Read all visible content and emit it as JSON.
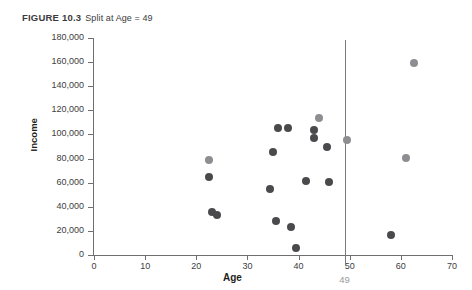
{
  "caption": {
    "label": "FIGURE 10.3",
    "text": "Split at Age = 49"
  },
  "chart_data": {
    "type": "scatter",
    "title": "Split at Age = 49",
    "xlabel": "Age",
    "ylabel": "Income",
    "xlim": [
      0,
      70
    ],
    "ylim": [
      0,
      180000
    ],
    "xticks": [
      0,
      10,
      20,
      30,
      40,
      50,
      60,
      70
    ],
    "xtick_labels": [
      "0",
      "10",
      "20",
      "30",
      "40",
      "50",
      "60",
      "70"
    ],
    "yticks": [
      0,
      20000,
      40000,
      60000,
      80000,
      100000,
      120000,
      140000,
      160000,
      180000
    ],
    "ytick_labels": [
      "0",
      "20,000",
      "40,000",
      "60,000",
      "80,000",
      "100,000",
      "120,000",
      "140,000",
      "160,000",
      "180,000"
    ],
    "grid": false,
    "legend": "none",
    "colors": {
      "dark_point": "#4a4a4c",
      "light_point": "#8e8e92",
      "axis": "#6f6f72",
      "split_line": "#7a7a7e",
      "split_label": "#9a9a9e"
    },
    "annotations": [
      {
        "name": "split-line",
        "type": "vertical-line",
        "x": 49,
        "label": "49"
      }
    ],
    "points": [
      {
        "age": 22.5,
        "income": 79000,
        "shade": "light"
      },
      {
        "age": 22.5,
        "income": 65000,
        "shade": "dark"
      },
      {
        "age": 23,
        "income": 35500,
        "shade": "dark"
      },
      {
        "age": 24,
        "income": 33500,
        "shade": "dark"
      },
      {
        "age": 34.5,
        "income": 55000,
        "shade": "dark"
      },
      {
        "age": 35,
        "income": 85500,
        "shade": "dark"
      },
      {
        "age": 35.5,
        "income": 28500,
        "shade": "dark"
      },
      {
        "age": 36,
        "income": 105000,
        "shade": "dark"
      },
      {
        "age": 38,
        "income": 105500,
        "shade": "dark"
      },
      {
        "age": 38.5,
        "income": 23500,
        "shade": "dark"
      },
      {
        "age": 39.5,
        "income": 5500,
        "shade": "dark"
      },
      {
        "age": 41.5,
        "income": 61500,
        "shade": "dark"
      },
      {
        "age": 43,
        "income": 104000,
        "shade": "dark"
      },
      {
        "age": 43,
        "income": 97000,
        "shade": "dark"
      },
      {
        "age": 44,
        "income": 114000,
        "shade": "light"
      },
      {
        "age": 45.5,
        "income": 90000,
        "shade": "dark"
      },
      {
        "age": 46,
        "income": 60500,
        "shade": "dark"
      },
      {
        "age": 49.5,
        "income": 95500,
        "shade": "light"
      },
      {
        "age": 58,
        "income": 16500,
        "shade": "dark"
      },
      {
        "age": 61,
        "income": 80500,
        "shade": "light"
      },
      {
        "age": 62.5,
        "income": 159000,
        "shade": "light"
      }
    ]
  }
}
